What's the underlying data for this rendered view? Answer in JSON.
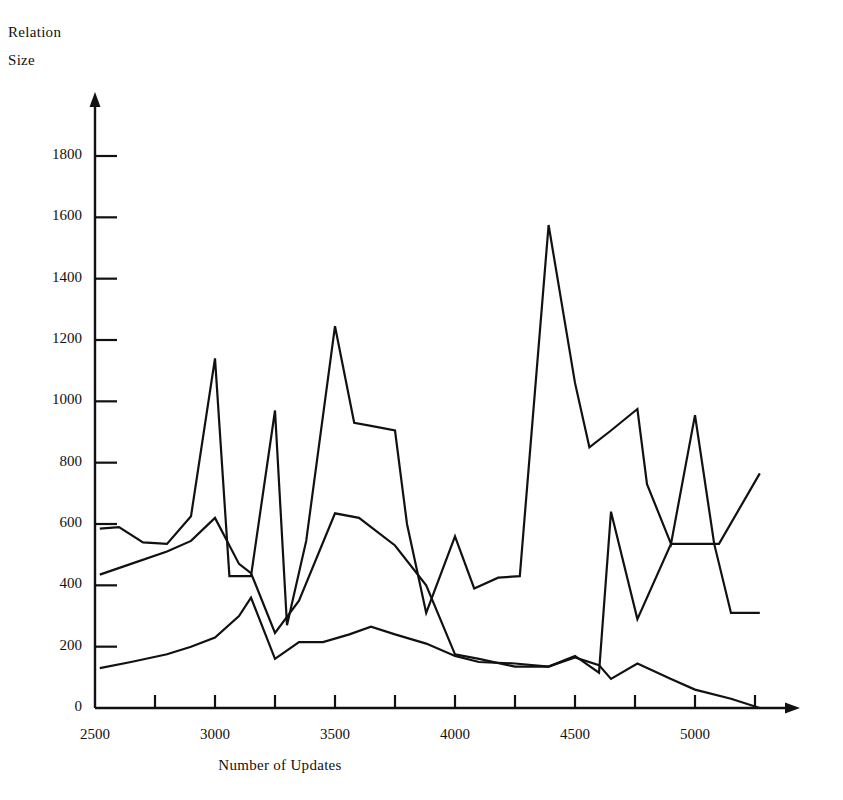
{
  "chart_data": {
    "type": "line",
    "title": "",
    "xlabel": "Number of Updates",
    "ylabel": "Relation Size",
    "ylabel_lines": [
      "Relation",
      "Size"
    ],
    "xlim": [
      2500,
      5270
    ],
    "ylim": [
      0,
      1900
    ],
    "grid": false,
    "legend": "none",
    "x_ticks_major": [
      2500,
      3000,
      3500,
      4000,
      4500,
      5000
    ],
    "x_ticks_major_labels": [
      "2500",
      "3000",
      "3500",
      "4000",
      "4500",
      "5000"
    ],
    "x_ticks_minor": [
      2750,
      3250,
      3750,
      4250,
      4750,
      5250
    ],
    "y_ticks": [
      0,
      200,
      400,
      600,
      800,
      1000,
      1200,
      1400,
      1600,
      1800
    ],
    "y_tick_labels": [
      "0",
      "200",
      "400",
      "600",
      "800",
      "1000",
      "1200",
      "1400",
      "1600",
      "1800"
    ],
    "line_color": "#111111",
    "series": [
      {
        "name": "series-upper",
        "x": [
          2520,
          2600,
          2700,
          2800,
          2900,
          3000,
          3060,
          3150,
          3250,
          3300,
          3380,
          3500,
          3580,
          3650,
          3750,
          3800,
          3880,
          4000,
          4080,
          4180,
          4270,
          4390,
          4500,
          4560,
          4650,
          4760,
          4800,
          4900,
          5000,
          5080,
          5150,
          5270
        ],
        "values": [
          585,
          590,
          540,
          535,
          625,
          1140,
          430,
          430,
          970,
          270,
          545,
          1245,
          930,
          920,
          905,
          600,
          310,
          560,
          390,
          425,
          430,
          1575,
          1060,
          850,
          905,
          975,
          730,
          535,
          955,
          535,
          310,
          310
        ]
      },
      {
        "name": "series-middle",
        "x": [
          2520,
          2650,
          2800,
          2900,
          3000,
          3100,
          3150,
          3250,
          3350,
          3500,
          3600,
          3750,
          3880,
          4000,
          4100,
          4250,
          4390,
          4500,
          4600,
          4650,
          4760,
          4900,
          5000,
          5100,
          5270
        ],
        "values": [
          435,
          470,
          510,
          545,
          620,
          470,
          440,
          245,
          350,
          635,
          620,
          530,
          400,
          175,
          160,
          135,
          135,
          170,
          115,
          640,
          290,
          535,
          535,
          535,
          765
        ]
      },
      {
        "name": "series-lower",
        "x": [
          2520,
          2650,
          2800,
          2900,
          3000,
          3100,
          3150,
          3250,
          3350,
          3450,
          3560,
          3650,
          3750,
          3880,
          4000,
          4100,
          4250,
          4390,
          4500,
          4600,
          4650,
          4760,
          4900,
          5000,
          5150,
          5270
        ],
        "values": [
          130,
          150,
          175,
          200,
          230,
          300,
          360,
          160,
          215,
          215,
          240,
          265,
          240,
          210,
          170,
          150,
          145,
          135,
          165,
          140,
          95,
          145,
          95,
          60,
          30,
          0
        ]
      }
    ]
  }
}
